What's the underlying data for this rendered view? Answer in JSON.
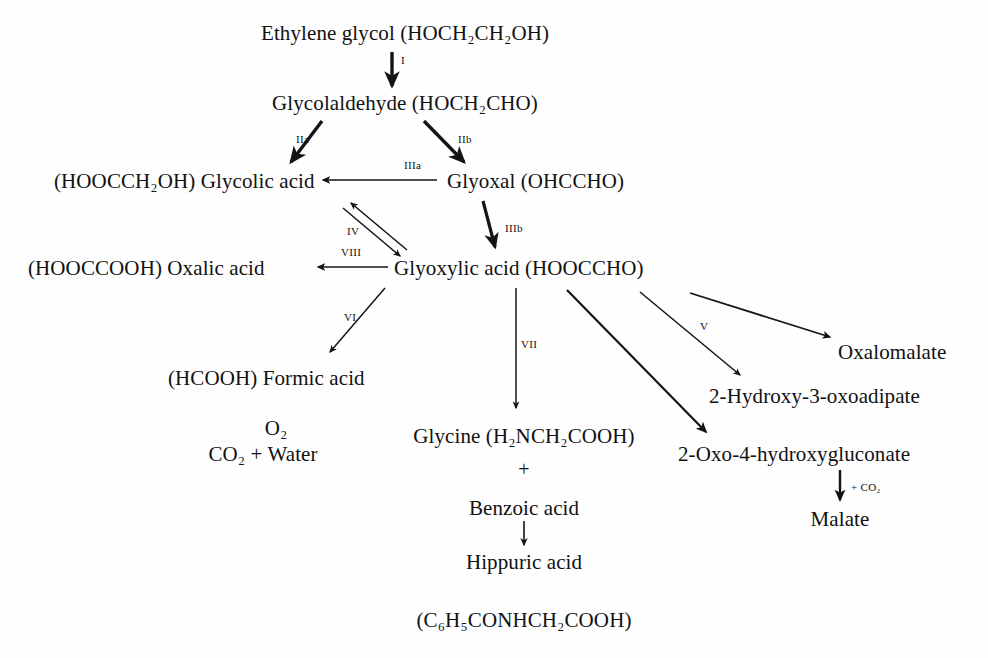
{
  "diagram": {
    "line_color": "#141414",
    "background": "#fefefe",
    "nodes": [
      {
        "id": "ethylene-glycol",
        "label": "Ethylene glycol (HOCH₂CH₂OH)",
        "x": 405,
        "y": 22,
        "align": "center"
      },
      {
        "id": "glycolaldehyde",
        "label": "Glycolaldehyde (HOCH₂CHO)",
        "x": 405,
        "y": 92,
        "align": "center"
      },
      {
        "id": "glycolic-acid",
        "label": "(HOOCCH₂OH) Glycolic acid",
        "x": 54,
        "y": 170,
        "align": "left"
      },
      {
        "id": "glyoxal",
        "label": "Glyoxal (OHCCHO)",
        "x": 447,
        "y": 170,
        "align": "left"
      },
      {
        "id": "oxalic-acid",
        "label": "(HOOCCOOH) Oxalic acid",
        "x": 28,
        "y": 257,
        "align": "left"
      },
      {
        "id": "glyoxylic-acid",
        "label": "Glyoxylic acid (HOOCCHO)",
        "x": 394,
        "y": 257,
        "align": "left"
      },
      {
        "id": "formic-acid",
        "label": "(HCOOH) Formic acid",
        "x": 168,
        "y": 367,
        "align": "left"
      },
      {
        "id": "oxalomalate",
        "label": "Oxalomalate",
        "x": 838,
        "y": 341,
        "align": "left"
      },
      {
        "id": "hydroxy-oxoadipate",
        "label": "2-Hydroxy-3-oxoadipate",
        "x": 709,
        "y": 385,
        "align": "left"
      },
      {
        "id": "glycine",
        "label": "Glycine (H₂NCH₂COOH)",
        "x": 524,
        "y": 425,
        "align": "center"
      },
      {
        "id": "oxo-hydroxygluconate",
        "label": "2-Oxo-4-hydroxygluconate",
        "x": 678,
        "y": 443,
        "align": "left"
      },
      {
        "id": "oxygen",
        "label": "O₂",
        "x": 276,
        "y": 417,
        "align": "center"
      },
      {
        "id": "co2-water",
        "label": "CO₂ + Water",
        "x": 263,
        "y": 443,
        "align": "center"
      },
      {
        "id": "benzoic-acid",
        "label": "Benzoic acid",
        "x": 524,
        "y": 497,
        "align": "center"
      },
      {
        "id": "malate",
        "label": "Malate",
        "x": 840,
        "y": 508,
        "align": "center"
      },
      {
        "id": "hippuric-acid",
        "label": "Hippuric acid",
        "x": 524,
        "y": 551,
        "align": "center"
      },
      {
        "id": "hippuric-formula",
        "label": "(C₆H₅CONHCH₂COOH)",
        "x": 524,
        "y": 609,
        "align": "center"
      }
    ],
    "plus_signs": [
      {
        "id": "glycine-benzoic-plus",
        "label": "+",
        "x": 524,
        "y": 458
      }
    ],
    "step_labels": [
      {
        "id": "step-I",
        "label": "I",
        "x": 401,
        "y": 54,
        "size": "tiny"
      },
      {
        "id": "step-IIa",
        "label": "IIa",
        "x": 296,
        "y": 133,
        "size": "tiny"
      },
      {
        "id": "step-IIb",
        "label": "IIb",
        "x": 458,
        "y": 133,
        "size": "tiny"
      },
      {
        "id": "step-IIIa",
        "label": "IIIa",
        "x": 404,
        "y": 159,
        "size": "tiny"
      },
      {
        "id": "step-IIIb",
        "label": "IIIb",
        "x": 505,
        "y": 222,
        "size": "tiny"
      },
      {
        "id": "step-IV",
        "label": "IV",
        "x": 347,
        "y": 225,
        "size": "tiny"
      },
      {
        "id": "step-VIII",
        "label": "VIII",
        "x": 341,
        "y": 246,
        "size": "tiny"
      },
      {
        "id": "step-VI",
        "label": "VI",
        "x": 344,
        "y": 311,
        "size": "tiny"
      },
      {
        "id": "step-VII",
        "label": "VII",
        "x": 521,
        "y": 338,
        "size": "tiny"
      },
      {
        "id": "step-V",
        "label": "V",
        "x": 700,
        "y": 320,
        "size": "tiny"
      },
      {
        "id": "step-co2",
        "label": "+ CO₂",
        "x": 851,
        "y": 481,
        "size": "tiny"
      }
    ],
    "edges": [
      {
        "id": "edge-ethylene-to-glycolaldehyde",
        "from": "ethylene-glycol",
        "to": "glycolaldehyde",
        "x1": 392,
        "y1": 52,
        "x2": 392,
        "y2": 86,
        "width": 3.4
      },
      {
        "id": "edge-glycolaldehyde-to-glycolic",
        "from": "glycolaldehyde",
        "to": "glycolic-acid",
        "x1": 322,
        "y1": 121,
        "x2": 291,
        "y2": 162,
        "width": 3.4
      },
      {
        "id": "edge-glycolaldehyde-to-glyoxal",
        "from": "glycolaldehyde",
        "to": "glyoxal",
        "x1": 424,
        "y1": 121,
        "x2": 464,
        "y2": 162,
        "width": 3.4
      },
      {
        "id": "edge-glyoxal-to-glycolic",
        "from": "glyoxal",
        "to": "glycolic-acid",
        "x1": 437,
        "y1": 180,
        "x2": 323,
        "y2": 180,
        "width": 1.7
      },
      {
        "id": "edge-glyoxal-to-glyoxylic",
        "from": "glyoxal",
        "to": "glyoxylic-acid",
        "x1": 483,
        "y1": 201,
        "x2": 495,
        "y2": 247,
        "width": 3.2
      },
      {
        "id": "edge-glyoxylic-to-glycolic",
        "from": "glyoxylic-acid",
        "to": "glycolic-acid",
        "x1": 407,
        "y1": 250,
        "x2": 351,
        "y2": 203,
        "width": 1.5
      },
      {
        "id": "edge-glycolic-to-glyoxylic",
        "from": "glycolic-acid",
        "to": "glyoxylic-acid",
        "x1": 343,
        "y1": 208,
        "x2": 400,
        "y2": 256,
        "width": 1.5
      },
      {
        "id": "edge-glyoxylic-to-oxalic",
        "from": "glyoxylic-acid",
        "to": "oxalic-acid",
        "x1": 388,
        "y1": 267,
        "x2": 318,
        "y2": 267,
        "width": 1.7
      },
      {
        "id": "edge-glyoxylic-to-formic",
        "from": "glyoxylic-acid",
        "to": "formic-acid",
        "x1": 385,
        "y1": 288,
        "x2": 330,
        "y2": 352,
        "width": 1.5
      },
      {
        "id": "edge-glyoxylic-to-glycine",
        "from": "glyoxylic-acid",
        "to": "glycine",
        "x1": 516,
        "y1": 288,
        "x2": 516,
        "y2": 408,
        "width": 1.5
      },
      {
        "id": "edge-glyoxylic-to-gluconate",
        "from": "glyoxylic-acid",
        "to": "oxo-hydroxygluconate",
        "x1": 567,
        "y1": 290,
        "x2": 706,
        "y2": 432,
        "width": 2.2
      },
      {
        "id": "edge-glyoxylic-to-oxoadipate",
        "from": "glyoxylic-acid",
        "to": "hydroxy-oxoadipate",
        "x1": 640,
        "y1": 292,
        "x2": 740,
        "y2": 375,
        "width": 1.5
      },
      {
        "id": "edge-glyoxylic-to-oxalomalate",
        "from": "glyoxylic-acid",
        "to": "oxalomalate",
        "x1": 690,
        "y1": 293,
        "x2": 830,
        "y2": 337,
        "width": 1.7
      },
      {
        "id": "edge-gluconate-to-malate",
        "from": "oxo-hydroxygluconate",
        "to": "malate",
        "x1": 840,
        "y1": 470,
        "x2": 840,
        "y2": 500,
        "width": 2.4
      },
      {
        "id": "edge-benzoic-to-hippuric",
        "from": "benzoic-acid",
        "to": "hippuric-acid",
        "x1": 524,
        "y1": 521,
        "x2": 524,
        "y2": 545,
        "width": 1.6
      }
    ]
  }
}
